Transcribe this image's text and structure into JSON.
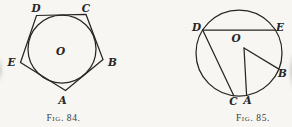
{
  "colors": {
    "paper": "#f7f6f2",
    "ink": "#262626",
    "ink-soft": "#3a3a3a"
  },
  "figures": [
    {
      "name": "circle-inscribed-in-pentagon",
      "caption": "Fig. 84.",
      "labels": {
        "A": "A",
        "B": "B",
        "C": "C",
        "D": "D",
        "E": "E",
        "O": "O"
      }
    },
    {
      "name": "circle-with-chords-DE-DC-and-radii-OA-OB",
      "caption": "Fig. 85.",
      "labels": {
        "A": "A",
        "B": "B",
        "C": "C",
        "D": "D",
        "E": "E",
        "O": "O"
      }
    }
  ]
}
